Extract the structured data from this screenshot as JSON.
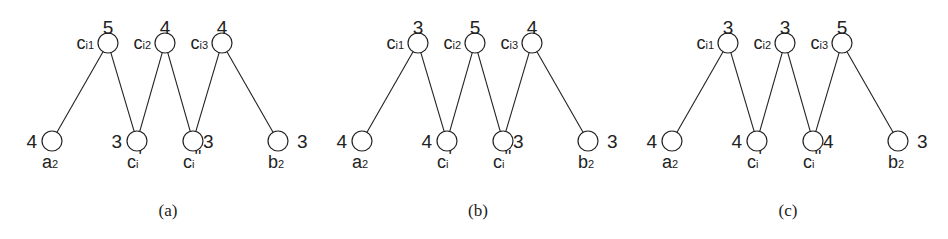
{
  "figure": {
    "panels": [
      {
        "id": "a",
        "caption": "(a)",
        "offset_x": 0,
        "top_nodes": [
          {
            "name": "c",
            "sub": "i1",
            "weight": "5"
          },
          {
            "name": "c",
            "sub": "i2",
            "weight": "4"
          },
          {
            "name": "c",
            "sub": "i3",
            "weight": "4"
          }
        ],
        "bottom_nodes": [
          {
            "name": "a",
            "sub": "2",
            "weight": "4"
          },
          {
            "name": "c",
            "sub": "i",
            "prime": "'",
            "weight": "3"
          },
          {
            "name": "c",
            "sub": "i",
            "prime": "''",
            "weight": "3"
          },
          {
            "name": "b",
            "sub": "2",
            "weight": "3"
          }
        ]
      },
      {
        "id": "b",
        "caption": "(b)",
        "offset_x": 310,
        "top_nodes": [
          {
            "name": "c",
            "sub": "i1",
            "weight": "3"
          },
          {
            "name": "c",
            "sub": "i2",
            "weight": "5"
          },
          {
            "name": "c",
            "sub": "i3",
            "weight": "4"
          }
        ],
        "bottom_nodes": [
          {
            "name": "a",
            "sub": "2",
            "weight": "4"
          },
          {
            "name": "c",
            "sub": "i",
            "prime": "'",
            "weight": "4"
          },
          {
            "name": "c",
            "sub": "i",
            "prime": "''",
            "weight": "3"
          },
          {
            "name": "b",
            "sub": "2",
            "weight": "3"
          }
        ]
      },
      {
        "id": "c",
        "caption": "(c)",
        "offset_x": 620,
        "top_nodes": [
          {
            "name": "c",
            "sub": "i1",
            "weight": "3"
          },
          {
            "name": "c",
            "sub": "i2",
            "weight": "3"
          },
          {
            "name": "c",
            "sub": "i3",
            "weight": "5"
          }
        ],
        "bottom_nodes": [
          {
            "name": "a",
            "sub": "2",
            "weight": "4"
          },
          {
            "name": "c",
            "sub": "i",
            "prime": "'",
            "weight": "4"
          },
          {
            "name": "c",
            "sub": "i",
            "prime": "''",
            "weight": "4"
          },
          {
            "name": "b",
            "sub": "2",
            "weight": "3"
          }
        ]
      }
    ],
    "edges": [
      [
        "top0",
        "bot0"
      ],
      [
        "top0",
        "bot1"
      ],
      [
        "top1",
        "bot1"
      ],
      [
        "top1",
        "bot2"
      ],
      [
        "top2",
        "bot2"
      ],
      [
        "top2",
        "bot3"
      ]
    ]
  }
}
